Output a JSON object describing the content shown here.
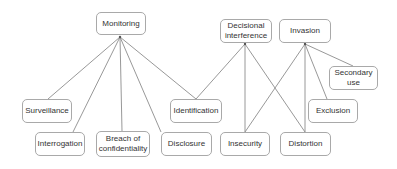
{
  "diagram": {
    "type": "taxonomy-tree",
    "line_color": "#8c8c8c",
    "border_color": "#a9a9a9",
    "nodes": [
      {
        "id": "monitoring",
        "label": "Monitoring",
        "x": 96,
        "y": 12,
        "w": 50,
        "h": 23,
        "anchor": [
          120,
          37
        ]
      },
      {
        "id": "decisional",
        "label": "Decisional\ninterference",
        "x": 220,
        "y": 19,
        "w": 52,
        "h": 24,
        "anchor": [
          245,
          44
        ]
      },
      {
        "id": "invasion",
        "label": "Invasion",
        "x": 279,
        "y": 19,
        "w": 52,
        "h": 24,
        "anchor": [
          305,
          44
        ]
      },
      {
        "id": "secondary",
        "label": "Secondary\nuse",
        "x": 329,
        "y": 66,
        "w": 49,
        "h": 24
      },
      {
        "id": "surveillance",
        "label": "Surveillance",
        "x": 22,
        "y": 99,
        "w": 50,
        "h": 24
      },
      {
        "id": "identification",
        "label": "Identification",
        "x": 170,
        "y": 99,
        "w": 52,
        "h": 24
      },
      {
        "id": "exclusion",
        "label": "Exclusion",
        "x": 308,
        "y": 99,
        "w": 50,
        "h": 24
      },
      {
        "id": "interrogation",
        "label": "Interrogation",
        "x": 35,
        "y": 132,
        "w": 50,
        "h": 24
      },
      {
        "id": "breach",
        "label": "Breach of\nconfidentiality",
        "x": 96,
        "y": 131,
        "w": 54,
        "h": 26
      },
      {
        "id": "disclosure",
        "label": "Disclosure",
        "x": 161,
        "y": 132,
        "w": 51,
        "h": 24
      },
      {
        "id": "insecurity",
        "label": "Insecurity",
        "x": 220,
        "y": 132,
        "w": 50,
        "h": 24
      },
      {
        "id": "distortion",
        "label": "Distortion",
        "x": 280,
        "y": 132,
        "w": 51,
        "h": 24
      }
    ],
    "edges": [
      {
        "from": "monitoring",
        "to": "surveillance",
        "x1": 120,
        "y1": 37,
        "x2": 48,
        "y2": 99
      },
      {
        "from": "monitoring",
        "to": "interrogation",
        "x1": 120,
        "y1": 37,
        "x2": 73,
        "y2": 132
      },
      {
        "from": "monitoring",
        "to": "breach",
        "x1": 120,
        "y1": 37,
        "x2": 122,
        "y2": 131
      },
      {
        "from": "monitoring",
        "to": "disclosure",
        "x1": 120,
        "y1": 37,
        "x2": 161,
        "y2": 132
      },
      {
        "from": "monitoring",
        "to": "identification",
        "x1": 120,
        "y1": 37,
        "x2": 196,
        "y2": 99
      },
      {
        "from": "decisional",
        "to": "identification",
        "x1": 245,
        "y1": 44,
        "x2": 196,
        "y2": 99
      },
      {
        "from": "decisional",
        "to": "insecurity",
        "x1": 245,
        "y1": 44,
        "x2": 245,
        "y2": 132
      },
      {
        "from": "decisional",
        "to": "distortion",
        "x1": 245,
        "y1": 44,
        "x2": 305,
        "y2": 132
      },
      {
        "from": "invasion",
        "to": "insecurity",
        "x1": 305,
        "y1": 44,
        "x2": 245,
        "y2": 132
      },
      {
        "from": "invasion",
        "to": "distortion",
        "x1": 305,
        "y1": 44,
        "x2": 305,
        "y2": 132
      },
      {
        "from": "invasion",
        "to": "exclusion",
        "x1": 305,
        "y1": 44,
        "x2": 327,
        "y2": 99
      },
      {
        "from": "invasion",
        "to": "secondary",
        "x1": 305,
        "y1": 44,
        "x2": 353,
        "y2": 66
      }
    ]
  }
}
